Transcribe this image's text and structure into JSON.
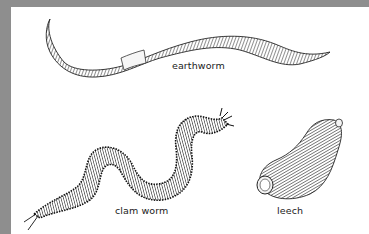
{
  "figure": {
    "background": "#ffffff",
    "border_color": "#8e8e8e",
    "ink_color": "#1a1a1a",
    "specimens": [
      {
        "id": "earthworm",
        "label": "earthworm"
      },
      {
        "id": "clam-worm",
        "label": "clam worm"
      },
      {
        "id": "leech",
        "label": "leech"
      }
    ]
  }
}
